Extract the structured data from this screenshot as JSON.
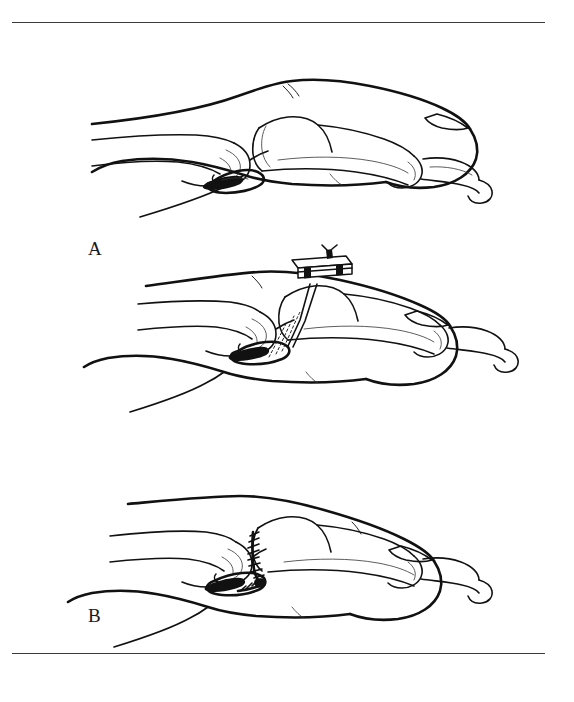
{
  "figure": {
    "background_color": "#ffffff",
    "ink_color": "#111111",
    "rule_color": "#3a3a3a",
    "width": 574,
    "height": 702,
    "rules": [
      {
        "name": "top-rule",
        "y": 22
      },
      {
        "name": "bottom-rule",
        "y": 653
      }
    ],
    "panels": [
      {
        "label": "A",
        "caption": "Lateral view of the finger showing the avulsed volar plate at the proximal interphalangeal joint with the bony fragment displaced into the joint",
        "label_x": 88,
        "label_y": 205,
        "structures": [
          "proximal phalanx",
          "middle phalanx",
          "distal phalanx",
          "fingernail",
          "proximal interphalangeal joint",
          "distal interphalangeal joint",
          "avulsed volar plate",
          "volar plate bone fragment",
          "soft tissue outline of finger pulp"
        ]
      },
      {
        "label": "B",
        "caption": "Pull-out suture passed through the volar plate, drilled across the middle phalanx and tied over a dorsal button on the skin surface",
        "label_x": 88,
        "label_y": 382,
        "structures": [
          "dorsal pull-out button",
          "button retaining posts",
          "pull-out suture limbs",
          "suture tract through bone shown dashed",
          "volar plate drawn down to bone bed",
          "proximal phalanx",
          "middle phalanx",
          "distal phalanx",
          "fingernail"
        ]
      },
      {
        "label": "C",
        "caption": "Final construct with the volar plate reattached to the volar base of the middle phalanx and the joint reduced in slight flexion",
        "label_x": 88,
        "label_y": 618,
        "structures": [
          "reattached volar plate",
          "ladder of repair sutures at volar base of middle phalanx",
          "reduced proximal interphalangeal joint",
          "proximal phalanx",
          "middle phalanx",
          "distal phalanx",
          "fingernail"
        ]
      }
    ]
  }
}
